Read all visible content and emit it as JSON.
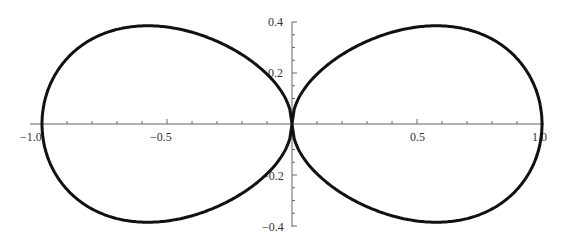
{
  "chart_data": {
    "type": "line",
    "title": "",
    "xlabel": "",
    "ylabel": "",
    "xlim": [
      -1.0,
      1.0
    ],
    "ylim": [
      -0.4,
      0.4
    ],
    "x_ticks": [
      "-1.0",
      "-0.5",
      "0.5",
      "1.0"
    ],
    "y_ticks": [
      "0.4",
      "0.2",
      "-0.2",
      "-0.4"
    ],
    "grid": false,
    "series": [
      {
        "name": "figure-eight curve",
        "description": "closed two-lobe curve through origin, x from -1 to 1, peak |y| ~0.38 near |x| ~0.55"
      }
    ]
  },
  "labels": {
    "xm1": "−1.0",
    "xm05": "−0.5",
    "x05": "0.5",
    "x1": "1.0",
    "y04": "0.4",
    "y02": "0.2",
    "ym02": "−0.2",
    "ym04": "−0.4"
  }
}
